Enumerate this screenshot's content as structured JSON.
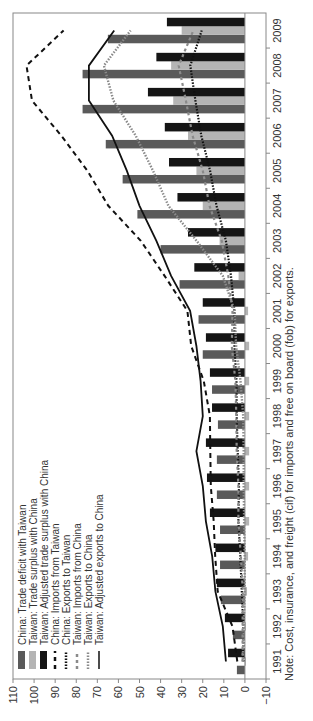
{
  "chart_data": {
    "type": "bar",
    "title": "",
    "xlabel": "",
    "ylabel": "",
    "ylim": [
      -10,
      110
    ],
    "yticks": [
      -10,
      0,
      10,
      20,
      30,
      40,
      50,
      60,
      70,
      80,
      90,
      100,
      110
    ],
    "categories": [
      "1991",
      "1992",
      "1993",
      "1994",
      "1995",
      "1996",
      "1997",
      "1998",
      "1999",
      "2000",
      "2001",
      "2002",
      "2003",
      "2004",
      "2005",
      "2006",
      "2007",
      "2008",
      "2009"
    ],
    "orientation_note": "figure rotated 90 degrees counter-clockwise",
    "series": [
      {
        "name": "China: Trade deficit with Taiwan",
        "kind": "bar",
        "color": "#5a5a5a",
        "values": [
          3.8,
          5.7,
          11.4,
          11.8,
          11.8,
          13.3,
          13.3,
          12.8,
          15.6,
          20,
          22,
          31,
          40,
          51,
          58,
          66,
          77,
          77,
          65
        ]
      },
      {
        "name": "Taiwan: Trade surplus with China",
        "kind": "bar",
        "color": "#b4b4b4",
        "values": [
          0,
          -0.5,
          -1,
          -1.5,
          -2,
          -2,
          -2,
          -2,
          -2,
          -2,
          -1.5,
          3,
          12,
          20,
          23,
          27,
          34,
          35,
          30
        ]
      },
      {
        "name": "Taiwan: Adjusted trade surplus with China",
        "kind": "bar",
        "color": "#151515",
        "values": [
          8,
          9.5,
          13.3,
          14,
          16.6,
          18,
          18.5,
          15.6,
          16.6,
          18.5,
          20,
          24,
          27,
          32,
          36,
          38,
          46,
          42,
          37
        ]
      },
      {
        "name": "China: Imports from Taiwan",
        "kind": "line",
        "style": "dashed-black",
        "color": "#111111",
        "values": [
          3.6,
          5.9,
          12.9,
          14.1,
          14.8,
          16.2,
          16.4,
          16.6,
          19.5,
          25.5,
          27.3,
          38.1,
          49.4,
          64.8,
          74.7,
          87.1,
          101,
          103.6,
          86
        ]
      },
      {
        "name": "China: Exports to Taiwan",
        "kind": "line",
        "style": "dotted-black",
        "color": "#111111",
        "values": [
          0.6,
          0.7,
          1.5,
          2.2,
          3.1,
          2.8,
          3.4,
          3.9,
          4,
          5,
          5,
          6.6,
          9,
          13.5,
          16.5,
          20.7,
          23.5,
          25.9,
          20.5
        ]
      },
      {
        "name": "Taiwan: Imports from China",
        "kind": "line",
        "style": "dashed-gray",
        "color": "#8a8a8a",
        "values": [
          1.1,
          1.1,
          1,
          1.9,
          3.1,
          3.1,
          3.9,
          4.1,
          4.5,
          6.2,
          5.9,
          7.9,
          11,
          16.8,
          20,
          24.8,
          28,
          31.4,
          24.5
        ]
      },
      {
        "name": "Taiwan: Exports to China",
        "kind": "line",
        "style": "dotted-gray",
        "color": "#8a8a8a",
        "values": [
          1,
          0.6,
          0.1,
          0.1,
          0.4,
          0.6,
          0.6,
          0.8,
          2.1,
          4.2,
          4.9,
          10.5,
          22.9,
          36.3,
          43.6,
          51.8,
          62.4,
          66.9,
          54.2
        ]
      },
      {
        "name": "Taiwan: Adjusted exports to China",
        "kind": "line",
        "style": "solid-black",
        "color": "#111111",
        "values": [
          9,
          10.5,
          14,
          15.5,
          18.5,
          20,
          23,
          20,
          21,
          23,
          26,
          35,
          42,
          50,
          56,
          63,
          74,
          74,
          62
        ]
      }
    ],
    "legend": {
      "position": "upper-left inside plot"
    },
    "grid": false
  },
  "legend_items": [
    {
      "label": "China: Trade deficit with Taiwan",
      "swatch": "bar-dark"
    },
    {
      "label": "Taiwan: Trade surplus with China",
      "swatch": "bar-light"
    },
    {
      "label": "Taiwan: Adjusted trade surplus with China",
      "swatch": "bar-black"
    },
    {
      "label": "China: Imports from Taiwan",
      "swatch": "dash-black"
    },
    {
      "label": "China: Exports to Taiwan",
      "swatch": "dot-black"
    },
    {
      "label": "Taiwan: Imports from China",
      "swatch": "dash-gray"
    },
    {
      "label": "Taiwan: Exports to China",
      "swatch": "dot-gray"
    },
    {
      "label": "Taiwan: Adjusted exports to China",
      "swatch": "line-black"
    }
  ],
  "note": "Note: Cost, insurance, and freight (cif) for imports and free on board (fob) for exports."
}
